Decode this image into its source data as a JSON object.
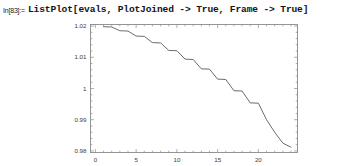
{
  "cell": {
    "in_label": "In[83]:=",
    "code": "ListPlot[evals, PlotJoined -> True, Frame -> True]"
  },
  "colors": {
    "frame": "#8a8a8a",
    "curve": "#5a5a5a",
    "tick_label": "#3a3a3a",
    "text": "#141414",
    "background": "#ffffff"
  },
  "chart_data": {
    "type": "line",
    "title": "",
    "xlabel": "",
    "ylabel": "",
    "grid": false,
    "frame": true,
    "legend": "none",
    "xlim": [
      -0.6,
      24.8
    ],
    "ylim": [
      0.9795,
      1.0205
    ],
    "xticks": [
      0,
      5,
      10,
      15,
      20
    ],
    "xtick_labels": [
      "0",
      "5",
      "10",
      "15",
      "20"
    ],
    "yticks": [
      0.98,
      0.99,
      1.0,
      1.01,
      1.02
    ],
    "ytick_labels": [
      "0.98",
      "0.99",
      "1",
      "1.01",
      "1.02"
    ],
    "x": [
      1,
      2,
      3,
      4,
      5,
      6,
      7,
      8,
      9,
      10,
      11,
      12,
      13,
      14,
      15,
      16,
      17,
      18,
      19,
      20,
      21,
      22,
      23,
      24
    ],
    "y": [
      1.0198,
      1.0197,
      1.0185,
      1.0184,
      1.0168,
      1.0167,
      1.0147,
      1.0146,
      1.0122,
      1.0121,
      1.0094,
      1.0093,
      1.0063,
      1.0062,
      1.003,
      1.0029,
      0.9993,
      0.9992,
      0.9954,
      0.9953,
      0.99,
      0.986,
      0.9825,
      0.9812
    ],
    "series": [
      {
        "name": "evals",
        "values": [
          1.0198,
          1.0197,
          1.0185,
          1.0184,
          1.0168,
          1.0167,
          1.0147,
          1.0146,
          1.0122,
          1.0121,
          1.0094,
          1.0093,
          1.0063,
          1.0062,
          1.003,
          1.0029,
          0.9993,
          0.9992,
          0.9954,
          0.9953,
          0.99,
          0.986,
          0.9825,
          0.9812
        ]
      }
    ]
  }
}
